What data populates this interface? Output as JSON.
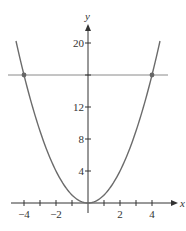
{
  "chart_data": {
    "type": "line",
    "title": "",
    "xlabel": "x",
    "ylabel": "y",
    "xlim": [
      -4.9,
      5.5
    ],
    "ylim": [
      0,
      22
    ],
    "grid": false,
    "legend": null,
    "x_ticks": [
      -4,
      -3,
      -2,
      -1,
      1,
      2,
      3,
      4
    ],
    "x_tick_labels": [
      {
        "value": -4,
        "label": "−4"
      },
      {
        "value": -2,
        "label": "−2"
      },
      {
        "value": 2,
        "label": "2"
      },
      {
        "value": 4,
        "label": "4"
      }
    ],
    "y_ticks": [
      4,
      8,
      12,
      16,
      20
    ],
    "y_tick_labels": [
      {
        "value": 4,
        "label": "4"
      },
      {
        "value": 8,
        "label": "8"
      },
      {
        "value": 12,
        "label": "12"
      },
      {
        "value": 20,
        "label": "20"
      }
    ],
    "series": [
      {
        "name": "y = x^2",
        "kind": "curve",
        "x": [
          -4.5,
          -4,
          -3,
          -2,
          -1,
          0,
          1,
          2,
          3,
          4,
          4.5
        ],
        "y": [
          20.25,
          16,
          9,
          4,
          1,
          0,
          1,
          4,
          9,
          16,
          20.25
        ]
      },
      {
        "name": "y = 16",
        "kind": "horizontal-line",
        "x": [
          -5,
          5
        ],
        "y": [
          16,
          16
        ]
      }
    ],
    "annotations": [
      {
        "type": "point",
        "x": -4,
        "y": 16
      },
      {
        "type": "point",
        "x": 4,
        "y": 16
      }
    ]
  },
  "style": {
    "curve_color": "#6b6b6b",
    "axis_color": "#333333",
    "line_color": "#8a8a8a",
    "point_color": "#666666"
  },
  "axes": {
    "x_label": "x",
    "y_label": "y"
  }
}
